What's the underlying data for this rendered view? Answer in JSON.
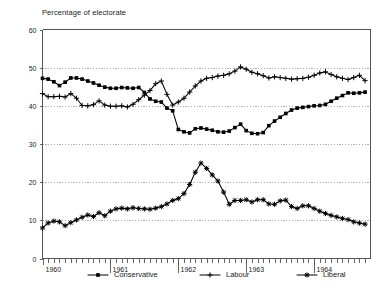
{
  "chart_data": {
    "type": "line",
    "title": "Percentage of electorate",
    "xlabel": "",
    "ylabel": "Percentage of electorate",
    "ylim": [
      0,
      60
    ],
    "yticks": [
      0,
      10,
      20,
      30,
      40,
      50,
      60
    ],
    "grid": "horizontal-dotted",
    "legend_position": "bottom",
    "xlim": [
      1960.0,
      1964.83
    ],
    "xticks_major": [
      "1960",
      "1961",
      "1962",
      "1963",
      "1964"
    ],
    "xtick_major_values": [
      1960,
      1961,
      1962,
      1963,
      1964
    ],
    "xtick_minor_interval_months": 1,
    "x": [
      1960.0,
      1960.083,
      1960.167,
      1960.25,
      1960.333,
      1960.417,
      1960.5,
      1960.583,
      1960.667,
      1960.75,
      1960.833,
      1960.917,
      1961.0,
      1961.083,
      1961.167,
      1961.25,
      1961.333,
      1961.417,
      1961.5,
      1961.583,
      1961.667,
      1961.75,
      1961.833,
      1961.917,
      1962.0,
      1962.083,
      1962.167,
      1962.25,
      1962.333,
      1962.417,
      1962.5,
      1962.583,
      1962.667,
      1962.75,
      1962.833,
      1962.917,
      1963.0,
      1963.083,
      1963.167,
      1963.25,
      1963.333,
      1963.417,
      1963.5,
      1963.583,
      1963.667,
      1963.75,
      1963.833,
      1963.917,
      1964.0,
      1964.083,
      1964.167,
      1964.25,
      1964.333,
      1964.417,
      1964.5,
      1964.583,
      1964.667,
      1964.75
    ],
    "series": [
      {
        "name": "Conservative",
        "marker": "square",
        "values": [
          47.2,
          47.0,
          46.3,
          45.3,
          46.2,
          47.3,
          47.3,
          47.0,
          46.5,
          46.0,
          45.4,
          44.9,
          44.6,
          44.6,
          44.8,
          44.7,
          44.6,
          44.8,
          43.5,
          41.8,
          41.2,
          41.0,
          39.4,
          38.7,
          33.8,
          33.2,
          32.9,
          34.0,
          34.2,
          33.9,
          33.6,
          33.2,
          33.1,
          33.4,
          34.3,
          35.2,
          33.5,
          32.8,
          32.7,
          33.0,
          34.8,
          36.0,
          37.0,
          38.0,
          38.9,
          39.4,
          39.6,
          39.8,
          40.0,
          40.1,
          40.4,
          41.2,
          42.0,
          42.7,
          43.4,
          43.3,
          43.4,
          43.6
        ]
      },
      {
        "name": "Labour",
        "marker": "plus",
        "values": [
          43.2,
          42.4,
          42.4,
          42.5,
          42.3,
          43.2,
          42.0,
          40.1,
          40.0,
          40.3,
          41.3,
          40.2,
          39.9,
          39.9,
          40.0,
          39.7,
          40.4,
          41.6,
          42.8,
          44.0,
          45.8,
          46.5,
          43.0,
          40.2,
          41.0,
          42.0,
          43.6,
          45.2,
          46.5,
          47.2,
          47.4,
          47.8,
          48.0,
          48.4,
          49.1,
          50.2,
          49.6,
          48.8,
          48.4,
          47.9,
          47.3,
          47.6,
          47.4,
          47.2,
          47.0,
          47.1,
          47.2,
          47.5,
          48.0,
          48.6,
          48.9,
          48.2,
          47.6,
          47.2,
          46.9,
          47.4,
          48.0,
          46.6
        ]
      },
      {
        "name": "Liberal",
        "marker": "asterisk",
        "values": [
          8.0,
          9.3,
          9.8,
          9.6,
          8.6,
          9.4,
          10.1,
          10.8,
          11.4,
          11.0,
          12.0,
          11.2,
          12.4,
          13.0,
          13.2,
          13.0,
          13.3,
          13.1,
          13.0,
          12.9,
          13.2,
          13.6,
          14.3,
          15.2,
          15.7,
          17.0,
          19.4,
          22.6,
          25.0,
          23.6,
          21.9,
          20.3,
          17.4,
          14.2,
          15.2,
          15.2,
          15.4,
          14.8,
          15.4,
          15.4,
          14.3,
          14.2,
          15.1,
          15.3,
          13.6,
          13.1,
          13.8,
          13.8,
          13.1,
          12.4,
          11.8,
          11.3,
          10.9,
          10.5,
          10.2,
          9.6,
          9.3,
          9.0
        ]
      }
    ]
  },
  "legend": {
    "items": [
      {
        "label": "Conservative",
        "marker": "square-line-marker"
      },
      {
        "label": "Labour",
        "marker": "plus-line-marker"
      },
      {
        "label": "Liberal",
        "marker": "asterisk-line-marker"
      }
    ]
  }
}
